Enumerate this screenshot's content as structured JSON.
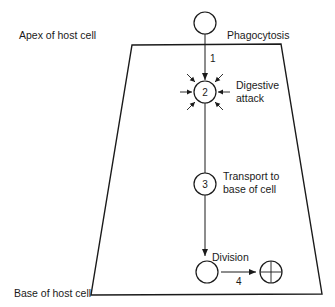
{
  "diagram": {
    "labels": {
      "apex": "Apex of host cell",
      "base": "Base of host cell",
      "phagocytosis": "Phagocytosis",
      "digestive_line1": "Digestive",
      "digestive_line2": "attack",
      "transport_line1": "Transport to",
      "transport_line2": "base of cell",
      "division": "Division"
    },
    "steps": {
      "step1": "1",
      "step2": "2",
      "step3": "3",
      "step4": "4"
    },
    "colors": {
      "ink": "#1a1a1a",
      "background": "#ffffff"
    }
  }
}
